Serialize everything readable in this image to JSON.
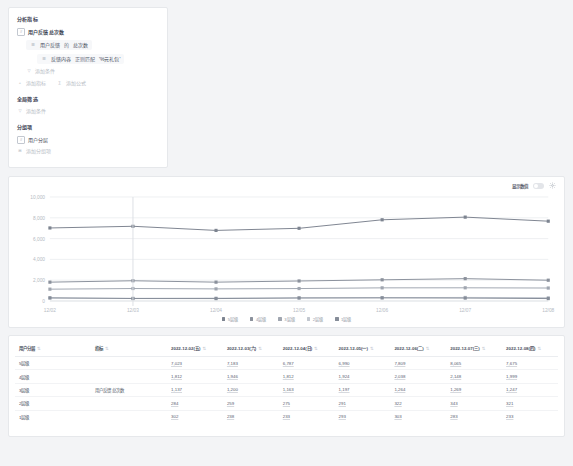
{
  "builder": {
    "metrics_title": "分析指标",
    "metric_row": {
      "icon": "hash-icon",
      "label": "用户反馈 总次数"
    },
    "metric_detail": {
      "icon": "list-icon",
      "event": "用户反馈",
      "connector": "的",
      "aggregation": "总次数"
    },
    "condition_chip": {
      "icon": "list-icon",
      "field": "反馈内容",
      "operator": "正则匹配",
      "value": "'%元礼包'"
    },
    "add_condition_inner": {
      "icon": "filter-icon",
      "label": "添加条件"
    },
    "add_metric": {
      "icon": "plus-icon",
      "label": "添加指标"
    },
    "add_formula": {
      "icon": "sigma-icon",
      "label": "添加公式"
    },
    "global_filter_title": "全局筛选",
    "global_add_condition": {
      "icon": "filter-icon",
      "label": "添加条件"
    },
    "group_title": "分组项",
    "group_row": {
      "icon": "hash-icon",
      "label": "用户分层"
    },
    "add_group": {
      "icon": "plus-icon",
      "label": "添加分组项"
    }
  },
  "chart": {
    "show_value_label": "显示数值",
    "show_value_on": false,
    "settings_icon": "gear-icon"
  },
  "chart_data": {
    "type": "line",
    "title": "",
    "xlabel": "",
    "ylabel": "",
    "x": [
      "12/02",
      "12/03",
      "12/04",
      "12/05",
      "12/06",
      "12/07",
      "12/08"
    ],
    "ylim": [
      0,
      10000
    ],
    "yticks": [
      0,
      2000,
      4000,
      6000,
      8000,
      10000
    ],
    "ytick_labels": [
      "0",
      "2,000",
      "4,000",
      "6,000",
      "8,000",
      "10,000"
    ],
    "grid": true,
    "legend_position": "bottom",
    "series": [
      {
        "name": "5层级",
        "color": "#7d8490",
        "values": [
          7023,
          7183,
          6787,
          6990,
          7809,
          8065,
          7675
        ]
      },
      {
        "name": "4层级",
        "color": "#8b919c",
        "values": [
          1812,
          1946,
          1812,
          1924,
          2038,
          2148,
          1999
        ]
      },
      {
        "name": "3层级",
        "color": "#a0a6b0",
        "values": [
          1137,
          1200,
          1163,
          1197,
          1264,
          1269,
          1247
        ]
      },
      {
        "name": "2层级",
        "color": "#c2c7cf",
        "values": [
          284,
          259,
          275,
          291,
          322,
          343,
          321
        ]
      },
      {
        "name": "1层级",
        "color": "#868d99",
        "values": [
          302,
          238,
          233,
          293,
          303,
          283,
          233
        ]
      }
    ]
  },
  "table": {
    "columns": [
      "用户分层",
      "指标",
      "2022-12-02(五)",
      "2022-12-03(六)",
      "2022-12-04(日)",
      "2022-12-05(一)",
      "2022-12-06(二)",
      "2022-12-07(三)",
      "2022-12-08(四)"
    ],
    "sorter_glyph": "⇅",
    "metric_name": "用户反馈 总次数",
    "rows": [
      {
        "tier": "5层级",
        "metric": "",
        "values": [
          "7,023",
          "7,183",
          "6,787",
          "6,990",
          "7,809",
          "8,065",
          "7,675"
        ]
      },
      {
        "tier": "4层级",
        "metric": "",
        "values": [
          "1,812",
          "1,946",
          "1,812",
          "1,924",
          "2,038",
          "2,148",
          "1,999"
        ]
      },
      {
        "tier": "3层级",
        "metric": "用户反馈 总次数",
        "values": [
          "1,137",
          "1,200",
          "1,163",
          "1,197",
          "1,264",
          "1,269",
          "1,247"
        ]
      },
      {
        "tier": "2层级",
        "metric": "",
        "values": [
          "284",
          "259",
          "275",
          "291",
          "322",
          "343",
          "321"
        ]
      },
      {
        "tier": "1层级",
        "metric": "",
        "values": [
          "302",
          "238",
          "233",
          "293",
          "303",
          "283",
          "233"
        ]
      }
    ]
  }
}
